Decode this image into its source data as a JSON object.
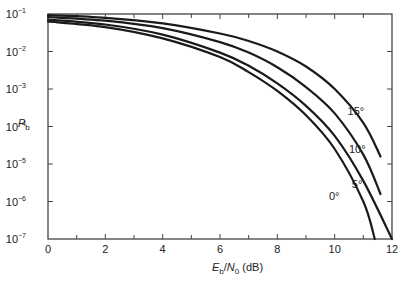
{
  "chart_data": {
    "type": "line",
    "title": "",
    "xlabel": "E_b/N_0 (dB)",
    "xlabel_parts": {
      "e": "E",
      "e_sub": "b",
      "slash": "/",
      "n": "N",
      "n_sub": "0",
      "unit": " (dB)"
    },
    "ylabel": "P_b",
    "ylabel_parts": {
      "p": "P",
      "p_sub": "b"
    },
    "xlim": [
      0,
      12
    ],
    "ylim": [
      1e-07,
      0.1
    ],
    "yscale": "log",
    "grid": false,
    "x_ticks": [
      0,
      2,
      4,
      6,
      8,
      10,
      12
    ],
    "x_minor_ticks": [
      1,
      3,
      5,
      7,
      9,
      11
    ],
    "y_ticks": [
      {
        "base": "10",
        "exp": "−1",
        "value": -1
      },
      {
        "base": "10",
        "exp": "−2",
        "value": -2
      },
      {
        "base": "10",
        "exp": "−3",
        "value": -3
      },
      {
        "base": "10",
        "exp": "−4",
        "value": -4
      },
      {
        "base": "10",
        "exp": "−5",
        "value": -5
      },
      {
        "base": "10",
        "exp": "−6",
        "value": -6
      },
      {
        "base": "10",
        "exp": "−7",
        "value": -7
      }
    ],
    "series": [
      {
        "name": "15°",
        "label": "15°",
        "x": [
          0,
          2,
          4,
          6,
          7,
          8,
          9,
          10,
          11,
          11.6
        ],
        "log10_y": [
          -1.03,
          -1.1,
          -1.25,
          -1.52,
          -1.72,
          -2.0,
          -2.4,
          -3.0,
          -3.9,
          -4.8
        ]
      },
      {
        "name": "10°",
        "label": "10°",
        "x": [
          0,
          2,
          4,
          6,
          7,
          8,
          9,
          10,
          11,
          11.6
        ],
        "log10_y": [
          -1.08,
          -1.18,
          -1.38,
          -1.75,
          -2.03,
          -2.42,
          -2.95,
          -3.65,
          -4.75,
          -5.8
        ]
      },
      {
        "name": "5°",
        "label": "5°",
        "x": [
          0,
          2,
          4,
          6,
          7,
          8,
          9,
          10,
          11,
          12
        ],
        "log10_y": [
          -1.15,
          -1.28,
          -1.55,
          -2.03,
          -2.38,
          -2.85,
          -3.45,
          -4.25,
          -5.45,
          -7.0
        ]
      },
      {
        "name": "0°",
        "label": "0°",
        "x": [
          0,
          2,
          4,
          6,
          7,
          8,
          9,
          10,
          11,
          11.4
        ],
        "log10_y": [
          -1.2,
          -1.35,
          -1.65,
          -2.15,
          -2.55,
          -3.05,
          -3.7,
          -4.6,
          -6.0,
          -7.0
        ]
      }
    ],
    "annotations": [
      {
        "text": "15°",
        "x": 10.45,
        "log10_y": -3.7
      },
      {
        "text": "10°",
        "x": 10.5,
        "log10_y": -4.7
      },
      {
        "text": "5°",
        "x": 10.6,
        "log10_y": -5.65
      },
      {
        "text": "0°",
        "x": 9.8,
        "log10_y": -5.95
      }
    ],
    "colors": {
      "line": "#1a1a1a",
      "axis": "#444444",
      "text": "#222222"
    }
  }
}
